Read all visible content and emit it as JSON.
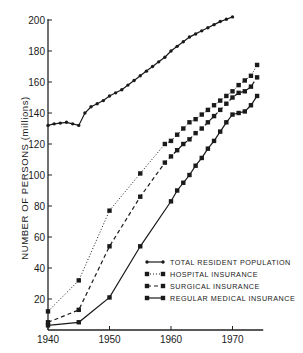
{
  "chart_data": {
    "type": "line",
    "title": "",
    "xlabel": "",
    "ylabel": "NUMBER OF PERSONS (millions)",
    "xlim": [
      1940,
      1975
    ],
    "ylim": [
      0,
      200
    ],
    "x_ticks": [
      1940,
      1950,
      1960,
      1970
    ],
    "y_ticks": [
      20,
      40,
      60,
      80,
      100,
      120,
      140,
      160,
      180,
      200
    ],
    "grid": false,
    "legend_position": "lower right",
    "series": [
      {
        "name": "TOTAL RESIDENT POPULATION",
        "style": "solid",
        "x": [
          1940,
          1941,
          1942,
          1943,
          1944,
          1945,
          1946,
          1947,
          1948,
          1949,
          1950,
          1951,
          1952,
          1953,
          1954,
          1955,
          1956,
          1957,
          1958,
          1959,
          1960,
          1961,
          1962,
          1963,
          1964,
          1965,
          1966,
          1967,
          1968,
          1969,
          1970
        ],
        "values": [
          132,
          133,
          133.5,
          134,
          133,
          132,
          140,
          144,
          146,
          148,
          151,
          153,
          155,
          158,
          161,
          164,
          167,
          170,
          173,
          176,
          180,
          183,
          186,
          189,
          191,
          193,
          195,
          197,
          199,
          200.5,
          202
        ]
      },
      {
        "name": "HOSPITAL INSURANCE",
        "style": "dotted",
        "x": [
          1940,
          1945,
          1950,
          1955,
          1959,
          1960,
          1961,
          1962,
          1963,
          1964,
          1965,
          1966,
          1967,
          1968,
          1969,
          1970,
          1971,
          1972,
          1973,
          1974
        ],
        "values": [
          12,
          32,
          77,
          101,
          120,
          122,
          126,
          130,
          134,
          136,
          139,
          142,
          145,
          148,
          151,
          154,
          158,
          161,
          164,
          171
        ]
      },
      {
        "name": "SURGICAL INSURANCE",
        "style": "dashed",
        "x": [
          1940,
          1945,
          1950,
          1955,
          1959,
          1960,
          1961,
          1962,
          1963,
          1964,
          1965,
          1966,
          1967,
          1968,
          1969,
          1970,
          1971,
          1972,
          1973,
          1974
        ],
        "values": [
          5,
          13,
          54,
          86,
          108,
          112,
          116,
          120,
          123,
          127,
          130,
          134,
          138,
          142,
          146,
          150,
          153,
          154,
          157,
          163
        ]
      },
      {
        "name": "REGULAR MEDICAL INSURANCE",
        "style": "solid",
        "x": [
          1940,
          1945,
          1950,
          1955,
          1960,
          1961,
          1962,
          1963,
          1964,
          1965,
          1966,
          1967,
          1968,
          1969,
          1970,
          1971,
          1972,
          1973,
          1974
        ],
        "values": [
          3,
          5,
          21,
          54,
          83,
          90,
          95,
          100,
          106,
          111,
          117,
          122,
          128,
          134,
          139,
          140,
          141,
          145,
          151
        ]
      }
    ]
  }
}
